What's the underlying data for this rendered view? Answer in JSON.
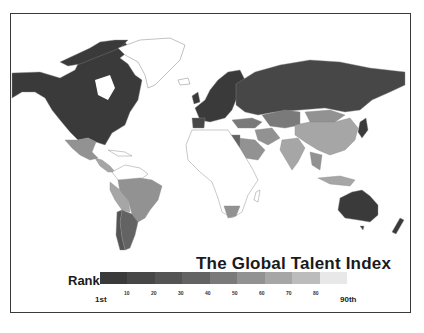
{
  "map": {
    "title": "The Global Talent Index",
    "legend": {
      "label": "Rank",
      "start_label": "1st",
      "end_label": "90th",
      "ticks": [
        "10",
        "20",
        "30",
        "40",
        "50",
        "60",
        "70",
        "80"
      ],
      "colors": [
        "#3a3a3a",
        "#474747",
        "#545454",
        "#636363",
        "#7a7a7a",
        "#929292",
        "#a6a6a6",
        "#bcbcbc",
        "#e8e8e8"
      ]
    },
    "regions": [
      {
        "name": "North America (USA, Canada)",
        "shade": "#3a3a3a"
      },
      {
        "name": "Mexico",
        "shade": "#929292"
      },
      {
        "name": "Central America",
        "shade": "#a6a6a6"
      },
      {
        "name": "Brazil",
        "shade": "#929292"
      },
      {
        "name": "Argentina",
        "shade": "#636363"
      },
      {
        "name": "Chile",
        "shade": "#545454"
      },
      {
        "name": "Western Europe",
        "shade": "#3a3a3a"
      },
      {
        "name": "Russia",
        "shade": "#474747"
      },
      {
        "name": "Kazakhstan",
        "shade": "#7a7a7a"
      },
      {
        "name": "China",
        "shade": "#a6a6a6"
      },
      {
        "name": "India",
        "shade": "#a6a6a6"
      },
      {
        "name": "Middle East",
        "shade": "#929292"
      },
      {
        "name": "Egypt",
        "shade": "#636363"
      },
      {
        "name": "South Africa",
        "shade": "#929292"
      },
      {
        "name": "Japan",
        "shade": "#3a3a3a"
      },
      {
        "name": "Australia",
        "shade": "#3a3a3a"
      },
      {
        "name": "New Zealand",
        "shade": "#3a3a3a"
      },
      {
        "name": "Southeast Asia",
        "shade": "#929292"
      },
      {
        "name": "Africa (unranked)",
        "shade": "#ffffff"
      },
      {
        "name": "Greenland (unranked)",
        "shade": "#ffffff"
      }
    ]
  }
}
